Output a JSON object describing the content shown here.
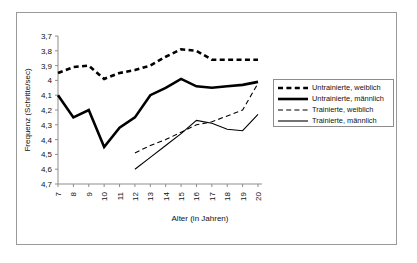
{
  "chart_data": {
    "type": "line",
    "title": "",
    "xlabel": "Alter (in Jahren)",
    "ylabel": "Frequenz (Schritte/sec)",
    "x": [
      7,
      8,
      9,
      10,
      11,
      12,
      13,
      14,
      15,
      16,
      17,
      18,
      19,
      20
    ],
    "xtick_labels": [
      "7",
      "8",
      "9",
      "10",
      "11",
      "12",
      "13",
      "14",
      "15",
      "16",
      "17",
      "18",
      "19",
      "20"
    ],
    "ytick_labels": [
      "3,7",
      "3,8",
      "3,9",
      "4",
      "4,1",
      "4,2",
      "4,3",
      "4,4",
      "4,5",
      "4,6",
      "4,7"
    ],
    "ytick_values": [
      3.7,
      3.8,
      3.9,
      4.0,
      4.1,
      4.2,
      4.3,
      4.4,
      4.5,
      4.6,
      4.7
    ],
    "ylim": [
      3.7,
      4.7
    ],
    "y_axis_inverted": true,
    "xlim": [
      7,
      20
    ],
    "grid": false,
    "legend_position": "right",
    "series": [
      {
        "name": "Untrainierte, weiblich",
        "style": "thick-dotted",
        "x": [
          7,
          8,
          9,
          10,
          11,
          12,
          13,
          14,
          15,
          16,
          17,
          18,
          19,
          20
        ],
        "values": [
          3.95,
          3.91,
          3.9,
          3.99,
          3.95,
          3.93,
          3.9,
          3.84,
          3.79,
          3.8,
          3.86,
          3.86,
          3.86,
          3.86
        ]
      },
      {
        "name": "Untrainierte, männlich",
        "style": "thick-solid",
        "x": [
          7,
          8,
          9,
          10,
          11,
          12,
          13,
          14,
          15,
          16,
          17,
          18,
          19,
          20
        ],
        "values": [
          4.1,
          4.25,
          4.2,
          4.45,
          4.32,
          4.25,
          4.1,
          4.05,
          3.99,
          4.04,
          4.05,
          4.04,
          4.03,
          4.01
        ]
      },
      {
        "name": "Trainierte, weiblich",
        "style": "thin-dashed",
        "x": [
          12,
          13,
          14,
          15,
          16,
          17,
          18,
          19,
          20
        ],
        "values": [
          4.49,
          4.44,
          4.4,
          4.35,
          4.3,
          4.28,
          4.24,
          4.2,
          4.02
        ]
      },
      {
        "name": "Trainierte, männlich",
        "style": "thin-solid",
        "x": [
          12,
          13,
          14,
          15,
          16,
          17,
          18,
          19,
          20
        ],
        "values": [
          4.6,
          4.52,
          4.44,
          4.36,
          4.27,
          4.29,
          4.33,
          4.34,
          4.23
        ]
      }
    ]
  }
}
